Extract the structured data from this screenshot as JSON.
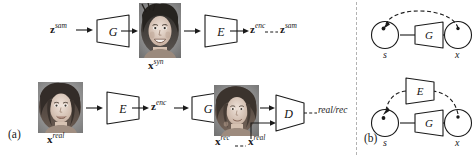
{
  "figure": {
    "width": 474,
    "height": 157,
    "background": "#ffffff",
    "stroke": "#1a1a1a",
    "divider_color": "#b3b3b3"
  },
  "panel_a": {
    "label": "(a)",
    "top_row": {
      "input_label": {
        "base": "z",
        "sup": "sam"
      },
      "generator_block": "G",
      "synth_image_label": {
        "base": "x",
        "sup": "syn"
      },
      "encoder_block": "E",
      "enc_label": {
        "base": "z",
        "sup": "enc"
      },
      "target_label": {
        "base": "z",
        "sup": "sam"
      },
      "image_alt": "synthetic-face-thumbnail"
    },
    "bottom_row": {
      "real_image_label": {
        "base": "x",
        "sup": "real"
      },
      "encoder_block": "E",
      "enc_label": {
        "base": "z",
        "sup": "enc"
      },
      "generator_block": "G",
      "rec_image_label": {
        "base": "x",
        "sup": "rec"
      },
      "real_label": {
        "base": "x",
        "sup": "real"
      },
      "discriminator_block": "D",
      "discriminator_output": "real/rec",
      "image_alt_real": "real-face-thumbnail",
      "image_alt_rec": "reconstructed-face-thumbnail"
    }
  },
  "panel_b": {
    "label": "(b)",
    "top_graph": {
      "source_node": "s",
      "target_node": "x",
      "generator_block": "G"
    },
    "bottom_graph": {
      "source_node": "s",
      "target_node": "x",
      "generator_block": "G",
      "encoder_block": "E"
    }
  }
}
